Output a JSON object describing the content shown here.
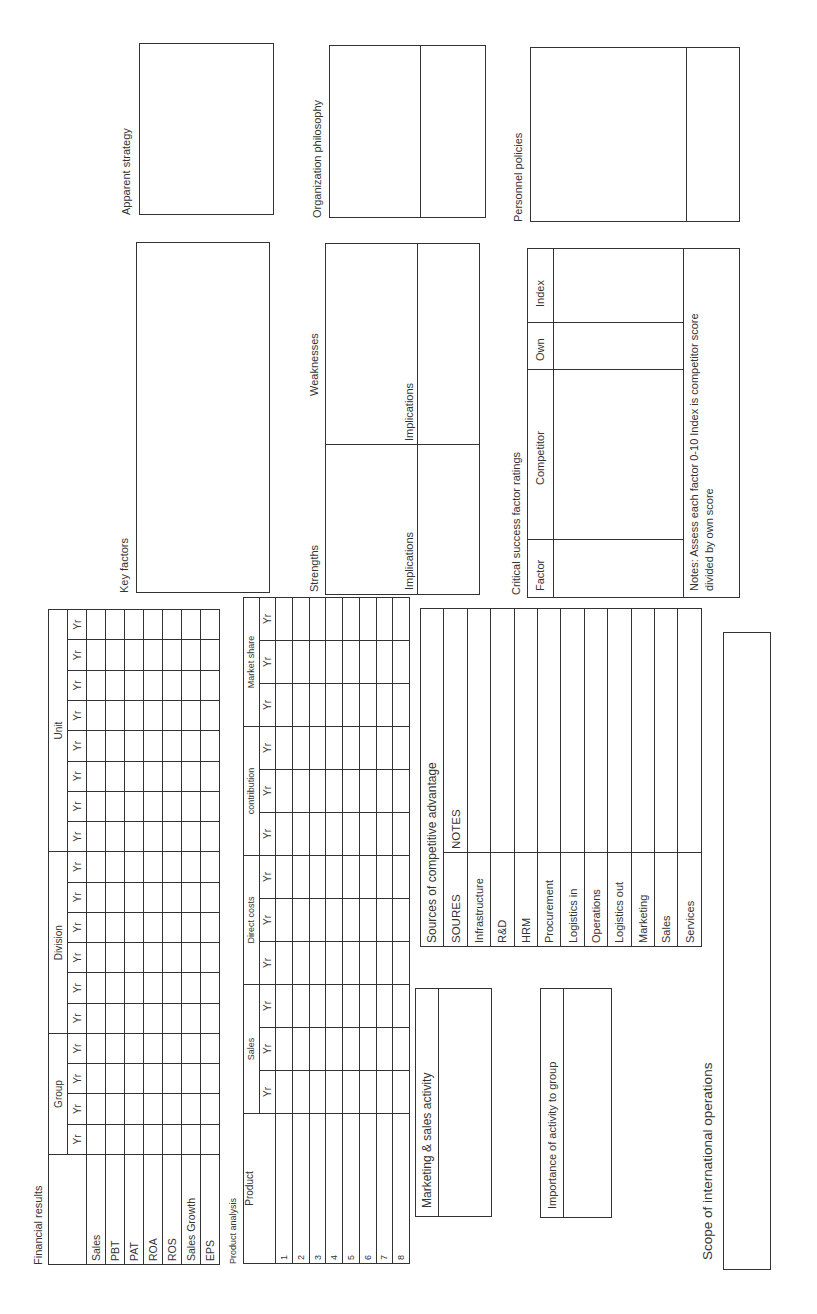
{
  "financial_results": {
    "title": "Financial results",
    "groups": [
      {
        "label": "Group",
        "years": [
          "Yr",
          "Yr",
          "Yr",
          "Yr",
          "Yr",
          "Yr"
        ]
      },
      {
        "label": "Division",
        "years": [
          "Yr",
          "Yr",
          "Yr",
          "Yr",
          "Yr",
          "Yr"
        ]
      },
      {
        "label": "Unit",
        "years": [
          "Yr",
          "Yr",
          "Yr",
          "Yr",
          "Yr",
          "Yr"
        ]
      }
    ],
    "rows": [
      "Sales",
      "PBT",
      "PAT",
      "ROA",
      "ROS",
      "Sales Growth",
      "EPS"
    ]
  },
  "product_analysis": {
    "title": "Product analysis",
    "product_header": "Product",
    "groups": [
      {
        "label": "Sales",
        "years": [
          "Yr",
          "Yr",
          "Yr"
        ]
      },
      {
        "label": "Direct costs",
        "years": [
          "Yr",
          "Yr",
          "Yr"
        ]
      },
      {
        "label": "contribution",
        "years": [
          "Yr",
          "Yr",
          "Yr"
        ]
      },
      {
        "label": "Market share",
        "years": [
          "Yr",
          "Yr",
          "Yr"
        ]
      }
    ],
    "rows": [
      "1",
      "2",
      "3",
      "4",
      "5",
      "6",
      "7",
      "8"
    ]
  },
  "marketing_sales_activity": {
    "label": "Marketing & sales activity"
  },
  "importance_of_activity": {
    "label": "Importance of activity to group"
  },
  "sources_of_advantage": {
    "title": "Sources of competitive advantage",
    "col_sources": "SOURES",
    "col_notes": "NOTES",
    "rows": [
      "Infrastructure",
      "R&D",
      "HRM",
      "Procurement",
      "Logistics in",
      "Operations",
      "Logistics out",
      "Marketing",
      "Sales",
      "Services"
    ]
  },
  "scope_international": {
    "label": "Scope of international operations"
  },
  "key_factors": {
    "label": "Key factors"
  },
  "strengths_weaknesses": {
    "strengths": "Strengths",
    "weaknesses": "Weaknesses",
    "implications_left": "Implications",
    "implications_right": "Implications"
  },
  "csf_ratings": {
    "title": "Critical success factor ratings",
    "col_factor": "Factor",
    "col_competitor": "Competitor",
    "col_own": "Own",
    "col_index": "Index",
    "notes_line1": "Notes: Assess each factor 0-10 Index is competitor score",
    "notes_line2": "divided by own score"
  },
  "apparent_strategy": {
    "label": "Apparent strategy"
  },
  "organization_philosophy": {
    "label": "Organization philosophy"
  },
  "personnel_policies": {
    "label": "Personnel policies"
  }
}
